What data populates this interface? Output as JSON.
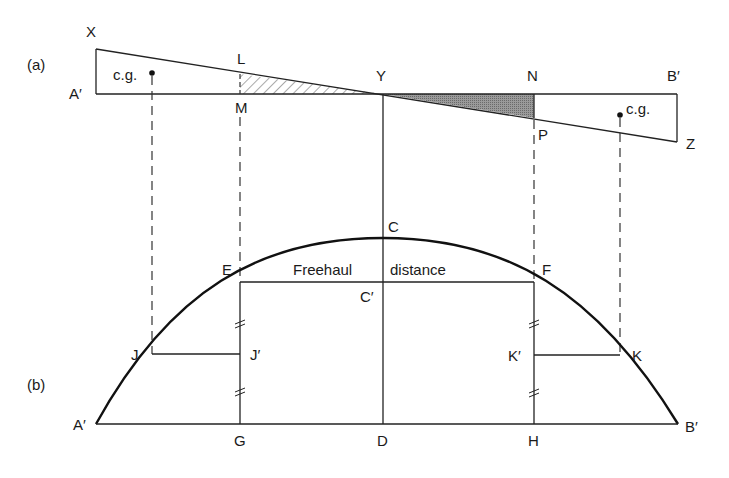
{
  "panels": {
    "a": {
      "label": "(a)"
    },
    "b": {
      "label": "(b)"
    }
  },
  "labels_a": {
    "X": "X",
    "L": "L",
    "Y": "Y",
    "N": "N",
    "B_prime": "B′",
    "A_prime": "A′",
    "M": "M",
    "P": "P",
    "Z": "Z",
    "cg_left": "c.g.",
    "cg_right": "c.g."
  },
  "labels_b": {
    "C": "C",
    "E": "E",
    "F": "F",
    "C_prime": "C′",
    "freehaul_left": "Freehaul",
    "freehaul_right": "distance",
    "J": "J",
    "J_prime": "J′",
    "K_prime": "K′",
    "K": "K",
    "A_prime": "A′",
    "G": "G",
    "D": "D",
    "H": "H",
    "B_prime": "B′"
  },
  "colors": {
    "line": "#222222",
    "hatch": "#555555",
    "shaded_fill": "#8c8c8c"
  }
}
